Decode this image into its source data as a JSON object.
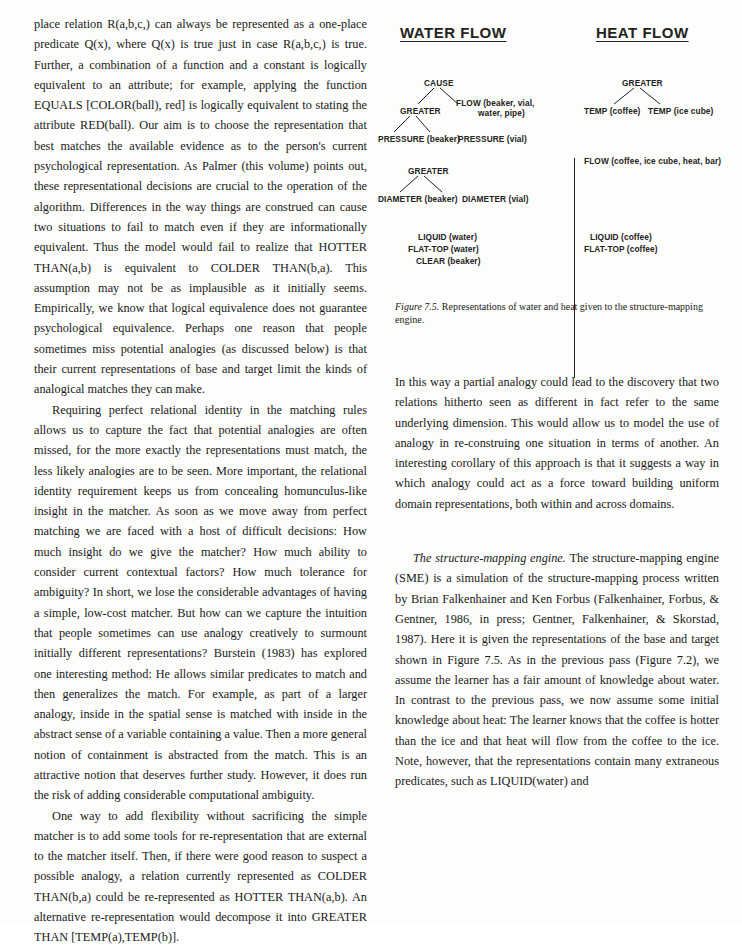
{
  "left_column": {
    "p1": "place relation R(a,b,c,) can always be represented as a one-place predicate Q(x), where Q(x) is true just in case R(a,b,c,) is true. Further, a combination of a function and a constant is logically equivalent to an attribute; for example, applying the function EQUALS [COLOR(ball), red] is logically equivalent to stating the attribute RED(ball). Our aim is to choose the representation that best matches the available evidence as to the person's current psychological representation. As Palmer (this volume) points out, these representational decisions are crucial to the operation of the algorithm. Differences in the way things are construed can cause two situations to fail to match even if they are informationally equivalent. Thus the model would fail to realize that HOTTER THAN(a,b) is equivalent to COLDER THAN(b,a). This assumption may not be as implausible as it initially seems. Empirically, we know that logical equivalence does not guarantee psychological equivalence. Perhaps one reason that people sometimes miss potential analogies (as discussed below) is that their current representations of base and target limit the kinds of analogical matches they can make.",
    "p2": "Requiring perfect relational identity in the matching rules allows us to capture the fact that potential analogies are often missed, for the more exactly the representations must match, the less likely analogies are to be seen. More important, the relational identity requirement keeps us from concealing homunculus-like insight in the matcher. As soon as we move away from perfect matching we are faced with a host of difficult decisions: How much insight do we give the matcher? How much ability to consider current contextual factors? How much tolerance for ambiguity? In short, we lose the considerable advantages of having a simple, low-cost matcher. But how can we capture the intuition that people sometimes can use analogy creatively to surmount initially different representations? Burstein (1983) has explored one interesting method: He allows similar predicates to match and then generalizes the match. For example, as part of a larger analogy, inside in the spatial sense is matched with inside in the abstract sense of a variable containing a value. Then a more general notion of containment is abstracted from the match. This is an attractive notion that deserves further study. However, it does run the risk of adding considerable computational ambiguity.",
    "p3": "One way to add flexibility without sacrificing the simple matcher is to add some tools for re-representation that are external to the matcher itself. Then, if there were good reason to suspect a possible analogy, a relation currently represented as COLDER THAN(b,a) could be re-represented as HOTTER THAN(a,b). An alternative re-representation would decompose it into GREATER THAN [TEMP(a),TEMP(b)]."
  },
  "figure": {
    "water_flow": {
      "title": "WATER FLOW",
      "cause": "CAUSE",
      "greater1": "GREATER",
      "pressure_beaker": "PRESSURE (beaker)",
      "pressure_vial": "PRESSURE (vial)",
      "flow": "FLOW (beaker, vial,",
      "flow2": "water, pipe)",
      "greater2": "GREATER",
      "diameter_beaker": "DIAMETER (beaker)",
      "diameter_vial": "DIAMETER (vial)",
      "liquid": "LIQUID (water)",
      "flat_top": "FLAT-TOP (water)",
      "clear": "CLEAR (beaker)"
    },
    "heat_flow": {
      "title": "HEAT FLOW",
      "greater": "GREATER",
      "temp_coffee": "TEMP (coffee)",
      "temp_ice": "TEMP (ice cube)",
      "flow": "FLOW (coffee, ice cube, heat, bar)",
      "liquid": "LIQUID (coffee)",
      "flat_top": "FLAT-TOP (coffee)"
    },
    "caption_label": "Figure 7.5.",
    "caption_text": " Representations of water and heat given to the structure-mapping engine."
  },
  "right_column": {
    "p1": "In this way a partial analogy could lead to the discovery that two relations hitherto seen as different in fact refer to the same underlying dimension. This would allow us to model the use of analogy in re-construing one situation in terms of another. An interesting corollary of this approach is that it suggests a way in which analogy could act as a force toward building uniform domain representations, both within and across domains.",
    "p2_heading": "The structure-mapping engine.",
    "p2": " The structure-mapping engine (SME) is a simulation of the structure-mapping process written by Brian Falkenhainer and Ken Forbus (Falkenhainer, Forbus, & Gentner, 1986, in press; Gentner, Falkenhainer, & Skorstad, 1987). Here it is given the representations of the base and target shown in Figure 7.5. As in the previous pass (Figure 7.2), we assume the learner has a fair amount of knowledge about water. In contrast to the previous pass, we now assume some initial knowledge about heat: The learner knows that the coffee is hotter than the ice and that heat will flow from the coffee to the ice. Note, however, that the representations contain many extraneous predicates, such as LIQUID(water) and"
  }
}
